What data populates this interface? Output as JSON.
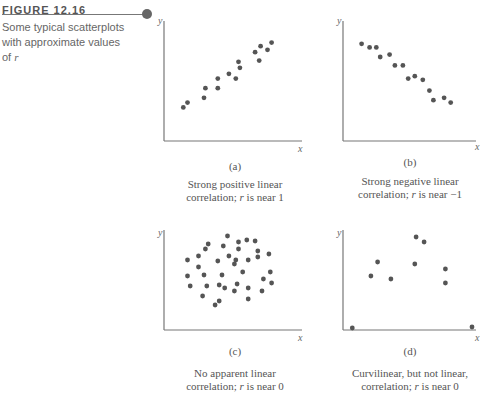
{
  "figure": {
    "label": "FIGURE 12.16",
    "caption_prefix": "Some typical scatterplots with approximate values of ",
    "caption_var": "r"
  },
  "chart_data": [
    {
      "type": "scatter",
      "id": "a",
      "sublabel": "(a)",
      "caption_line1": "Strong positive linear",
      "caption_line2": "correlation; r is near 1",
      "xlabel": "x",
      "ylabel": "y",
      "xlim": [
        0,
        100
      ],
      "ylim": [
        0,
        100
      ],
      "points": [
        [
          14,
          28
        ],
        [
          17,
          32
        ],
        [
          29,
          36
        ],
        [
          30,
          44
        ],
        [
          39,
          44
        ],
        [
          39,
          52
        ],
        [
          47,
          56
        ],
        [
          52,
          52
        ],
        [
          54,
          66
        ],
        [
          55,
          61
        ],
        [
          66,
          74
        ],
        [
          69,
          67
        ],
        [
          70,
          79
        ],
        [
          75,
          76
        ],
        [
          78,
          82
        ]
      ]
    },
    {
      "type": "scatter",
      "id": "b",
      "sublabel": "(b)",
      "caption_line1": "Strong negative linear",
      "caption_line2": "correlation; r is near −1",
      "xlabel": "x",
      "ylabel": "y",
      "xlim": [
        0,
        100
      ],
      "ylim": [
        0,
        100
      ],
      "points": [
        [
          14,
          81
        ],
        [
          20,
          78
        ],
        [
          25,
          78
        ],
        [
          28,
          70
        ],
        [
          35,
          72
        ],
        [
          39,
          63
        ],
        [
          45,
          63
        ],
        [
          49,
          52
        ],
        [
          54,
          54
        ],
        [
          60,
          51
        ],
        [
          65,
          42
        ],
        [
          68,
          34
        ],
        [
          76,
          36
        ],
        [
          81,
          32
        ]
      ]
    },
    {
      "type": "scatter",
      "id": "c",
      "sublabel": "(c)",
      "caption_line1": "No apparent linear",
      "caption_line2": "correlation; r is near 0",
      "xlabel": "x",
      "ylabel": "y",
      "xlim": [
        0,
        100
      ],
      "ylim": [
        0,
        100
      ],
      "points": [
        [
          46,
          94
        ],
        [
          32,
          86
        ],
        [
          54,
          88
        ],
        [
          60,
          90
        ],
        [
          66,
          89
        ],
        [
          30,
          81
        ],
        [
          43,
          84
        ],
        [
          54,
          81
        ],
        [
          68,
          79
        ],
        [
          17,
          70
        ],
        [
          25,
          74
        ],
        [
          47,
          74
        ],
        [
          52,
          70
        ],
        [
          61,
          70
        ],
        [
          68,
          73
        ],
        [
          76,
          76
        ],
        [
          39,
          69
        ],
        [
          51,
          66
        ],
        [
          25,
          63
        ],
        [
          42,
          55
        ],
        [
          57,
          58
        ],
        [
          77,
          58
        ],
        [
          17,
          54
        ],
        [
          29,
          55
        ],
        [
          78,
          47
        ],
        [
          72,
          51
        ],
        [
          19,
          44
        ],
        [
          31,
          44
        ],
        [
          40,
          45
        ],
        [
          44,
          42
        ],
        [
          53,
          46
        ],
        [
          61,
          42
        ],
        [
          71,
          39
        ],
        [
          28,
          34
        ],
        [
          51,
          39
        ],
        [
          40,
          29
        ],
        [
          61,
          31
        ],
        [
          37,
          25
        ]
      ]
    },
    {
      "type": "scatter",
      "id": "d",
      "sublabel": "(d)",
      "caption_line1": "Curvilinear, but not linear,",
      "caption_line2": "correlation; r is near 0",
      "xlabel": "x",
      "ylabel": "y",
      "xlim": [
        0,
        100
      ],
      "ylim": [
        0,
        100
      ],
      "points": [
        [
          7,
          2
        ],
        [
          21,
          54
        ],
        [
          26,
          68
        ],
        [
          36,
          51
        ],
        [
          54,
          66
        ],
        [
          55,
          93
        ],
        [
          61,
          88
        ],
        [
          77,
          61
        ],
        [
          77,
          47
        ],
        [
          97,
          3
        ]
      ]
    }
  ]
}
